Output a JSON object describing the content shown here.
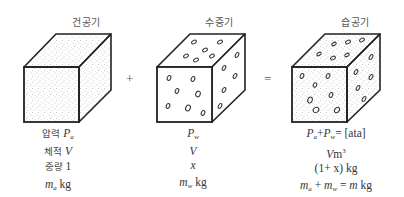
{
  "diagram": {
    "operators": {
      "plus": "+",
      "equals": "="
    },
    "components": [
      {
        "id": "dry-air",
        "title": "건공기",
        "fill": "stippled",
        "labels": {
          "pressure_label": "압력",
          "pressure_value": "P",
          "pressure_sub": "a",
          "volume_label": "체적",
          "volume_value": "V",
          "weight_label": "중량",
          "weight_value": "1",
          "mass_value": "m",
          "mass_sub": "a",
          "mass_unit": "kg"
        }
      },
      {
        "id": "water-vapor",
        "title": "수증기",
        "fill": "ovals",
        "labels": {
          "pressure_value": "P",
          "pressure_sub": "w",
          "volume_value": "V",
          "weight_value": "x",
          "mass_value": "m",
          "mass_sub": "w",
          "mass_unit": "kg"
        }
      },
      {
        "id": "moist-air",
        "title": "습공기",
        "fill": "stippled+ovals",
        "labels": {
          "pressure_a": "P",
          "pressure_a_sub": "a",
          "plus": "+",
          "pressure_w": "P",
          "pressure_w_sub": "w",
          "pressure_eq": "= [ata]",
          "volume_value": "V",
          "volume_unit": "m",
          "volume_exp": "3",
          "weight_value": "(1+ x) kg",
          "mass_a": "m",
          "mass_a_sub": "a",
          "mass_plus": " + ",
          "mass_w": "m",
          "mass_w_sub": "w",
          "mass_eq": " = ",
          "mass_total": "m",
          "mass_unit": " kg"
        }
      }
    ]
  }
}
